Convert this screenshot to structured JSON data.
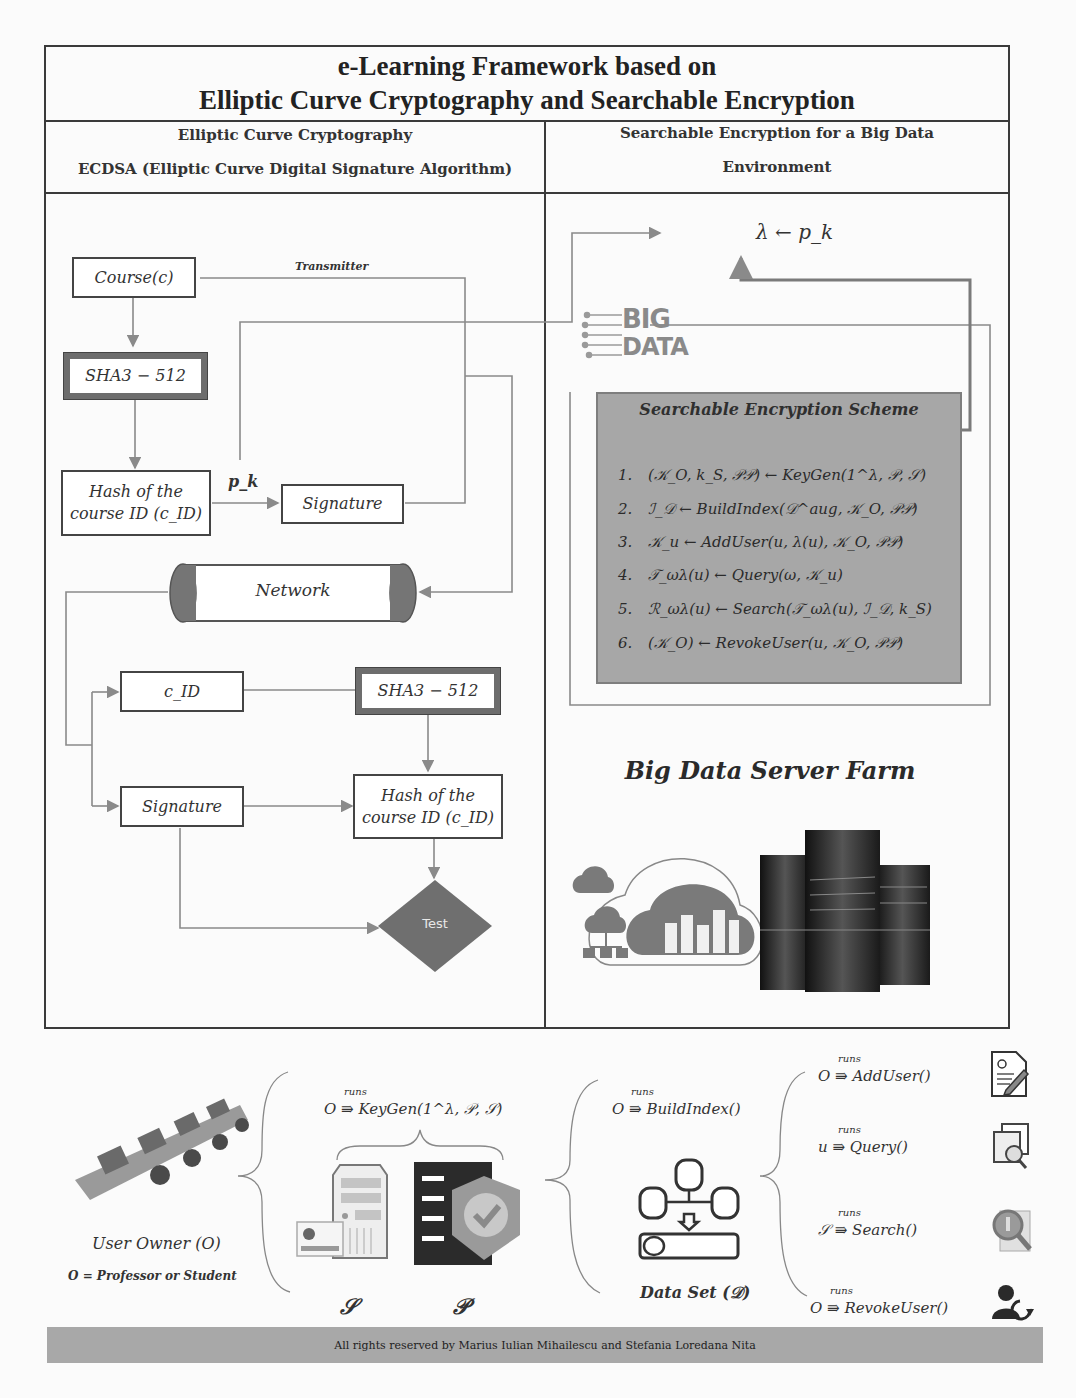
{
  "title": {
    "line1": "e-Learning Framework based on",
    "line2": "Elliptic Curve Cryptography and Searchable Encryption"
  },
  "left_header": {
    "line1": "Elliptic Curve Cryptography",
    "line2": "ECDSA (Elliptic Curve Digital Signature Algorithm)"
  },
  "right_header": {
    "line1": "Searchable Encryption for a Big Data",
    "line2": "Environment"
  },
  "ecdsa_flow": {
    "course": "Course(c)",
    "sha_top": "SHA3 − 512",
    "hash_top": [
      "Hash of the",
      "course ID (c_ID)"
    ],
    "pk_label": "p_k",
    "signature_top": "Signature",
    "transmitter_label": "Transmitter",
    "network": "Network",
    "cid": "c_ID",
    "sha_bottom": "SHA3 − 512",
    "signature_bottom": "Signature",
    "hash_bottom": [
      "Hash of the",
      "course ID (c_ID)"
    ],
    "test": "Test"
  },
  "se_panel": {
    "lambda_label": "λ ← p_k",
    "logo": {
      "line1": "BIG",
      "line2": "DATA"
    },
    "scheme_title": "Searchable Encryption Scheme",
    "steps": [
      {
        "n": "1.",
        "text": "(𝒦_O, k_S, 𝒫𝒫) ← KeyGen(1^λ, 𝒫, 𝒮)"
      },
      {
        "n": "2.",
        "text": "ℐ_𝒟 ← BuildIndex(𝒟^aug, 𝒦_O, 𝒫𝒫)"
      },
      {
        "n": "3.",
        "text": "𝒦_u ← AddUser(u, λ(u), 𝒦_O, 𝒫𝒫)"
      },
      {
        "n": "4.",
        "text": "𝒯_ωλ(u) ← Query(ω, 𝒦_u)"
      },
      {
        "n": "5.",
        "text": "ℛ_ωλ(u) ← Search(𝒯_ωλ(u), ℐ_𝒟, k_S)"
      },
      {
        "n": "6.",
        "text": "(𝒦_O) ← RevokeUser(u, 𝒦_O, 𝒫𝒫)"
      }
    ],
    "farm_title": "Big Data Server Farm"
  },
  "bottom": {
    "user_owner": "User Owner (O)",
    "user_def": "O = Professor or Student",
    "runs": "runs",
    "keygen": "O ⇛ KeyGen(1^λ, 𝒫, 𝒮)",
    "s_label": "𝒮",
    "p_label": "𝒫",
    "buildindex": "O ⇛ BuildIndex()",
    "dataset": "Data Set (𝒟)",
    "ops": [
      {
        "call": "O ⇛ AddUser()",
        "icon": "add-user-document-icon"
      },
      {
        "call": "u ⇛ Query()",
        "icon": "query-window-icon"
      },
      {
        "call": "𝒮 ⇛ Search()",
        "icon": "search-magnifier-icon"
      },
      {
        "call": "O ⇛ RevokeUser()",
        "icon": "revoke-user-icon"
      }
    ]
  },
  "footer": "All rights reserved by Marius Iulian Mihailescu and Stefania Loredana Nita",
  "colors": {
    "frame": "#3a3a3a",
    "connector": "#8a8a8a",
    "scheme_bg": "#a7a7a7",
    "test_diamond": "#6f6f6f",
    "footer_bg": "#a8a8a8"
  }
}
